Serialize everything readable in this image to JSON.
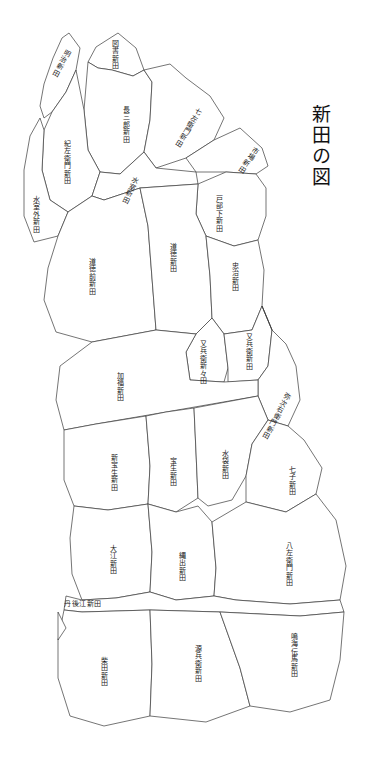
{
  "document": {
    "title": "新田の図",
    "kind": "historical-land-reclamation-map",
    "background_color": "#ffffff",
    "line_color": "#3a3a3a"
  },
  "title_block": {
    "text": "新田の図",
    "orientation": "vertical"
  },
  "map": {
    "regions": [
      {
        "id": "r01",
        "label": "明治新田",
        "x": 57,
        "y": 48,
        "rot": 28,
        "orient": "vertical"
      },
      {
        "id": "r02",
        "label": "図書新田",
        "x": 111,
        "y": 40,
        "rot": 0,
        "orient": "vertical"
      },
      {
        "id": "r03",
        "label": "長三郎新田",
        "x": 122,
        "y": 106,
        "rot": 0,
        "orient": "vertical"
      },
      {
        "id": "r04",
        "label": "七左衛門新田",
        "x": 184,
        "y": 105,
        "rot": 32,
        "orient": "vertical"
      },
      {
        "id": "r05",
        "label": "市場新田",
        "x": 244,
        "y": 145,
        "rot": 34,
        "orient": "vertical"
      },
      {
        "id": "r06",
        "label": "紀左衛門新田",
        "x": 63,
        "y": 140,
        "rot": 0,
        "orient": "vertical"
      },
      {
        "id": "r07",
        "label": "水室外新田",
        "x": 32,
        "y": 196,
        "rot": 0,
        "orient": "vertical"
      },
      {
        "id": "r08",
        "label": "水室新田",
        "x": 126,
        "y": 175,
        "rot": 26,
        "orient": "vertical"
      },
      {
        "id": "r09",
        "label": "戸部下新田",
        "x": 215,
        "y": 195,
        "rot": 0,
        "orient": "vertical"
      },
      {
        "id": "r10",
        "label": "道徳前新田",
        "x": 88,
        "y": 258,
        "rot": 0,
        "orient": "vertical"
      },
      {
        "id": "r11",
        "label": "道徳新田",
        "x": 169,
        "y": 243,
        "rot": 0,
        "orient": "vertical"
      },
      {
        "id": "r12",
        "label": "忠治新田",
        "x": 231,
        "y": 262,
        "rot": 0,
        "orient": "vertical"
      },
      {
        "id": "r13",
        "label": "又兵衛新々田",
        "x": 199,
        "y": 340,
        "rot": 0,
        "orient": "vertical"
      },
      {
        "id": "r14",
        "label": "又兵衛新田",
        "x": 245,
        "y": 333,
        "rot": 0,
        "orient": "vertical"
      },
      {
        "id": "r15",
        "label": "弥次右衛門新田",
        "x": 272,
        "y": 390,
        "rot": 28,
        "orient": "vertical"
      },
      {
        "id": "r16",
        "label": "加福新田",
        "x": 116,
        "y": 372,
        "rot": 0,
        "orient": "vertical"
      },
      {
        "id": "r17",
        "label": "新宝生新田",
        "x": 110,
        "y": 454,
        "rot": 0,
        "orient": "vertical"
      },
      {
        "id": "r18",
        "label": "宝生新田",
        "x": 169,
        "y": 457,
        "rot": 0,
        "orient": "vertical"
      },
      {
        "id": "r19",
        "label": "水袋新田",
        "x": 221,
        "y": 450,
        "rot": 0,
        "orient": "vertical"
      },
      {
        "id": "r20",
        "label": "七子新田",
        "x": 288,
        "y": 466,
        "rot": 0,
        "orient": "vertical"
      },
      {
        "id": "r21",
        "label": "大江新田",
        "x": 109,
        "y": 545,
        "rot": 0,
        "orient": "vertical"
      },
      {
        "id": "r22",
        "label": "縄出新田",
        "x": 178,
        "y": 552,
        "rot": 0,
        "orient": "vertical"
      },
      {
        "id": "r23",
        "label": "八左衛門新田",
        "x": 285,
        "y": 542,
        "rot": 0,
        "orient": "vertical"
      },
      {
        "id": "r24",
        "label": "丹後江新田",
        "x": 64,
        "y": 601,
        "rot": 0,
        "orient": "horizontal"
      },
      {
        "id": "r25",
        "label": "柴田新田",
        "x": 100,
        "y": 657,
        "rot": 0,
        "orient": "vertical"
      },
      {
        "id": "r26",
        "label": "源兵衛新田",
        "x": 194,
        "y": 645,
        "rot": 0,
        "orient": "vertical"
      },
      {
        "id": "r27",
        "label": "鳴海伝馬新田",
        "x": 290,
        "y": 633,
        "rot": 0,
        "orient": "vertical"
      }
    ],
    "region_count": 27
  }
}
